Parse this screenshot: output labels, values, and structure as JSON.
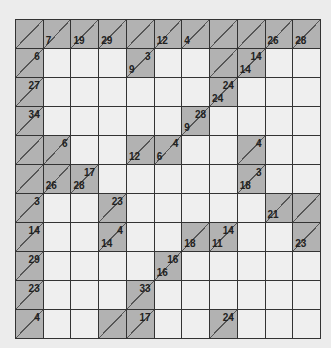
{
  "puzzle": {
    "type": "kakuro",
    "rows": 11,
    "cols": 11,
    "colors": {
      "block": "#b2b2b2",
      "white": "#efefef",
      "line": "#333333",
      "background": "#ececec"
    },
    "grid": [
      [
        {
          "b": 1
        },
        {
          "b": 1,
          "d": "7"
        },
        {
          "b": 1,
          "d": "19"
        },
        {
          "b": 1,
          "d": "29"
        },
        {
          "b": 1
        },
        {
          "b": 1,
          "d": "12"
        },
        {
          "b": 1,
          "d": "4"
        },
        {
          "b": 1
        },
        {
          "b": 1
        },
        {
          "b": 1,
          "d": "26"
        },
        {
          "b": 1,
          "d": "28"
        }
      ],
      [
        {
          "b": 1,
          "a": "6"
        },
        {
          "v": ""
        },
        {
          "v": ""
        },
        {
          "v": ""
        },
        {
          "b": 1,
          "d": "9",
          "a": "3"
        },
        {
          "v": ""
        },
        {
          "v": ""
        },
        {
          "b": 1
        },
        {
          "b": 1,
          "d": "14",
          "a": "14"
        },
        {
          "v": ""
        },
        {
          "v": ""
        }
      ],
      [
        {
          "b": 1,
          "a": "27"
        },
        {
          "v": ""
        },
        {
          "v": ""
        },
        {
          "v": ""
        },
        {
          "v": ""
        },
        {
          "v": ""
        },
        {
          "v": ""
        },
        {
          "b": 1,
          "d": "24",
          "a": "24"
        },
        {
          "v": ""
        },
        {
          "v": ""
        },
        {
          "v": ""
        }
      ],
      [
        {
          "b": 1,
          "a": "34"
        },
        {
          "v": ""
        },
        {
          "v": ""
        },
        {
          "v": ""
        },
        {
          "v": ""
        },
        {
          "v": ""
        },
        {
          "b": 1,
          "d": "9",
          "a": "28"
        },
        {
          "v": ""
        },
        {
          "v": ""
        },
        {
          "v": ""
        },
        {
          "v": ""
        }
      ],
      [
        {
          "b": 1
        },
        {
          "b": 1,
          "a": "6"
        },
        {
          "v": ""
        },
        {
          "v": ""
        },
        {
          "b": 1,
          "d": "12"
        },
        {
          "b": 1,
          "d": "6",
          "a": "4"
        },
        {
          "v": ""
        },
        {
          "v": ""
        },
        {
          "b": 1,
          "a": "4"
        },
        {
          "v": ""
        },
        {
          "v": ""
        }
      ],
      [
        {
          "b": 1
        },
        {
          "b": 1,
          "d": "26"
        },
        {
          "b": 1,
          "d": "28",
          "a": "17"
        },
        {
          "v": ""
        },
        {
          "v": ""
        },
        {
          "v": ""
        },
        {
          "v": ""
        },
        {
          "v": ""
        },
        {
          "b": 1,
          "d": "18",
          "a": "3"
        },
        {
          "v": ""
        },
        {
          "v": ""
        }
      ],
      [
        {
          "b": 1,
          "a": "3"
        },
        {
          "v": ""
        },
        {
          "v": ""
        },
        {
          "b": 1,
          "a": "23"
        },
        {
          "v": ""
        },
        {
          "v": ""
        },
        {
          "v": ""
        },
        {
          "v": ""
        },
        {
          "v": ""
        },
        {
          "b": 1,
          "d": "21"
        },
        {
          "b": 1
        }
      ],
      [
        {
          "b": 1,
          "a": "14"
        },
        {
          "v": ""
        },
        {
          "v": ""
        },
        {
          "b": 1,
          "d": "14",
          "a": "4"
        },
        {
          "v": ""
        },
        {
          "v": ""
        },
        {
          "b": 1,
          "d": "18"
        },
        {
          "b": 1,
          "d": "11",
          "a": "14"
        },
        {
          "v": ""
        },
        {
          "v": ""
        },
        {
          "b": 1,
          "d": "23"
        }
      ],
      [
        {
          "b": 1,
          "a": "29"
        },
        {
          "v": ""
        },
        {
          "v": ""
        },
        {
          "v": ""
        },
        {
          "v": ""
        },
        {
          "b": 1,
          "d": "16",
          "a": "16"
        },
        {
          "v": ""
        },
        {
          "v": ""
        },
        {
          "v": ""
        },
        {
          "v": ""
        },
        {
          "v": ""
        }
      ],
      [
        {
          "b": 1,
          "a": "23"
        },
        {
          "v": ""
        },
        {
          "v": ""
        },
        {
          "v": ""
        },
        {
          "b": 1,
          "a": "33"
        },
        {
          "v": ""
        },
        {
          "v": ""
        },
        {
          "v": ""
        },
        {
          "v": ""
        },
        {
          "v": ""
        },
        {
          "v": ""
        }
      ],
      [
        {
          "b": 1,
          "a": "4"
        },
        {
          "v": ""
        },
        {
          "v": ""
        },
        {
          "b": 1
        },
        {
          "b": 1,
          "a": "17"
        },
        {
          "v": ""
        },
        {
          "v": ""
        },
        {
          "b": 1,
          "a": "24"
        },
        {
          "v": ""
        },
        {
          "v": ""
        },
        {
          "v": ""
        }
      ]
    ]
  }
}
